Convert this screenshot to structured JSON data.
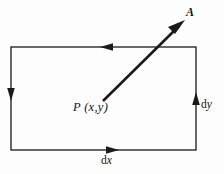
{
  "figure": {
    "background_color": "#fdfdfd",
    "stroke_color": "#1a1a1a",
    "labels": {
      "vector": "A",
      "point": "P (x,y)",
      "dy_prefix": "d",
      "dy_var": "y",
      "dx_prefix": "d",
      "dx_var": "x"
    },
    "rectangle": {
      "left": 11,
      "top": 47,
      "right": 196,
      "bottom": 150,
      "width": 185,
      "height": 103
    },
    "circulation_direction": "counter-clockwise",
    "edge_arrows": [
      {
        "edge": "top",
        "direction": "left",
        "x": 106,
        "y": 47
      },
      {
        "edge": "left",
        "direction": "down",
        "x": 11,
        "y": 95
      },
      {
        "edge": "bottom",
        "direction": "right",
        "x": 113,
        "y": 150
      },
      {
        "edge": "right",
        "direction": "up",
        "x": 196,
        "y": 99
      }
    ],
    "vector_arrow": {
      "tail_x": 103,
      "tail_y": 101,
      "tip_x": 184,
      "tip_y": 21
    }
  }
}
